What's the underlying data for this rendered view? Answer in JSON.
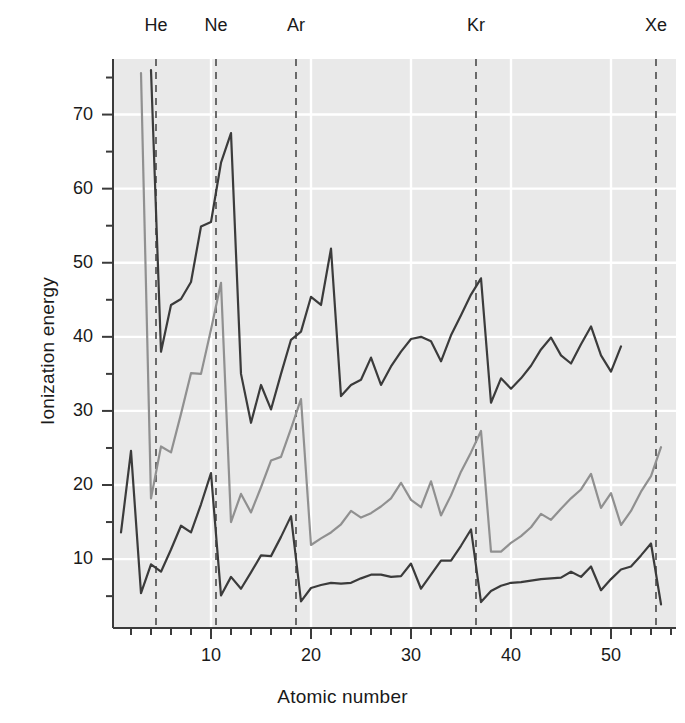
{
  "chart_data": {
    "type": "line",
    "title": "",
    "xlabel": "Atomic number",
    "ylabel": "Ionization energy",
    "xlim": [
      0.2,
      56.5
    ],
    "ylim": [
      0.7,
      77.5
    ],
    "grid": true,
    "legend_position": "none",
    "background_color": "#e9e9e9",
    "gridline_color": "#ffffff",
    "xticks_major": [
      10,
      20,
      30,
      40,
      50
    ],
    "xticks_minor": [
      2,
      4,
      6,
      8,
      12,
      14,
      16,
      18,
      22,
      24,
      26,
      28,
      32,
      34,
      36,
      38,
      42,
      44,
      46,
      48,
      52,
      54,
      56
    ],
    "yticks_major": [
      10,
      20,
      30,
      40,
      50,
      60,
      70
    ],
    "yticks_minor": [
      5,
      15,
      25,
      35,
      45,
      55,
      65,
      75
    ],
    "xtick_labels": [
      "10",
      "20",
      "30",
      "40",
      "50"
    ],
    "ytick_labels": [
      "10",
      "20",
      "30",
      "40",
      "50",
      "60",
      "70"
    ],
    "annotations": [
      {
        "label": "He",
        "x": 4.5,
        "type": "vertical-dashed-line",
        "color": "#4a4a4a"
      },
      {
        "label": "Ne",
        "x": 10.5,
        "type": "vertical-dashed-line",
        "color": "#4a4a4a"
      },
      {
        "label": "Ar",
        "x": 18.5,
        "type": "vertical-dashed-line",
        "color": "#4a4a4a"
      },
      {
        "label": "Kr",
        "x": 36.5,
        "type": "vertical-dashed-line",
        "color": "#4a4a4a"
      },
      {
        "label": "Xe",
        "x": 54.5,
        "type": "vertical-dashed-line",
        "color": "#4a4a4a"
      }
    ],
    "series": [
      {
        "name": "first-ionization-energy",
        "color": "#3b3b3b",
        "width": 2.2,
        "x": [
          1,
          2,
          3,
          4,
          5,
          6,
          7,
          8,
          9,
          10,
          11,
          12,
          13,
          14,
          15,
          16,
          17,
          18,
          19,
          20,
          21,
          22,
          23,
          24,
          25,
          26,
          27,
          28,
          29,
          30,
          31,
          32,
          33,
          34,
          35,
          36,
          37,
          38,
          39,
          40,
          41,
          42,
          43,
          44,
          45,
          46,
          47,
          48,
          49,
          50,
          51,
          52,
          53,
          54,
          55
        ],
        "values": [
          13.6,
          24.6,
          5.4,
          9.3,
          8.3,
          11.3,
          14.5,
          13.6,
          17.4,
          21.6,
          5.1,
          7.6,
          6.0,
          8.2,
          10.5,
          10.4,
          13.0,
          15.8,
          4.3,
          6.1,
          6.5,
          6.8,
          6.7,
          6.8,
          7.4,
          7.9,
          7.9,
          7.6,
          7.7,
          9.4,
          6.0,
          7.9,
          9.8,
          9.8,
          11.8,
          14.0,
          4.2,
          5.7,
          6.4,
          6.8,
          6.9,
          7.1,
          7.3,
          7.4,
          7.5,
          8.3,
          7.6,
          9.0,
          5.8,
          7.3,
          8.6,
          9.0,
          10.5,
          12.1,
          3.9
        ]
      },
      {
        "name": "second-ionization-energy",
        "color": "#909090",
        "width": 2.2,
        "x": [
          3,
          4,
          5,
          6,
          7,
          8,
          9,
          10,
          11,
          12,
          13,
          14,
          15,
          16,
          17,
          18,
          19,
          20,
          21,
          22,
          23,
          24,
          25,
          26,
          27,
          28,
          29,
          30,
          31,
          32,
          33,
          34,
          35,
          36,
          37,
          38,
          39,
          40,
          41,
          42,
          43,
          44,
          45,
          46,
          47,
          48,
          49,
          50,
          51,
          52,
          53,
          54,
          55
        ],
        "values": [
          75.6,
          18.2,
          25.2,
          24.4,
          29.6,
          35.1,
          35.0,
          41.0,
          47.3,
          15.0,
          18.8,
          16.3,
          19.7,
          23.3,
          23.8,
          27.6,
          31.6,
          11.9,
          12.8,
          13.6,
          14.7,
          16.5,
          15.6,
          16.2,
          17.1,
          18.2,
          20.3,
          18.0,
          17.0,
          20.5,
          15.9,
          18.6,
          21.8,
          24.4,
          27.3,
          11.0,
          11.0,
          12.2,
          13.1,
          14.3,
          16.1,
          15.3,
          16.8,
          18.2,
          19.4,
          21.5,
          16.9,
          18.9,
          14.6,
          16.5,
          19.1,
          21.2,
          25.1
        ]
      },
      {
        "name": "third-ionization-energy",
        "color": "#3b3b3b",
        "width": 2.2,
        "x": [
          4,
          5,
          6,
          7,
          8,
          9,
          10,
          11,
          12,
          13,
          14,
          15,
          16,
          17,
          18,
          19,
          20,
          21,
          22,
          23,
          24,
          25,
          26,
          27,
          28,
          29,
          30,
          31,
          32,
          33,
          34,
          35,
          36,
          37,
          38,
          39,
          40,
          41,
          42,
          43,
          44,
          45,
          46,
          47,
          48,
          49,
          50,
          51
        ],
        "values": [
          76.0,
          38.0,
          44.3,
          45.1,
          47.4,
          54.9,
          55.5,
          63.5,
          67.5,
          35.0,
          28.4,
          33.5,
          30.2,
          35.0,
          39.6,
          40.7,
          45.4,
          44.3,
          51.9,
          32.0,
          33.5,
          34.2,
          37.2,
          33.5,
          36.0,
          38.0,
          39.7,
          40.0,
          39.4,
          36.7,
          40.2,
          42.9,
          45.7,
          47.9,
          31.1,
          34.4,
          33.0,
          34.4,
          36.1,
          38.3,
          39.9,
          37.5,
          36.4,
          39.0,
          41.4,
          37.5,
          35.3,
          38.7
        ]
      }
    ]
  }
}
